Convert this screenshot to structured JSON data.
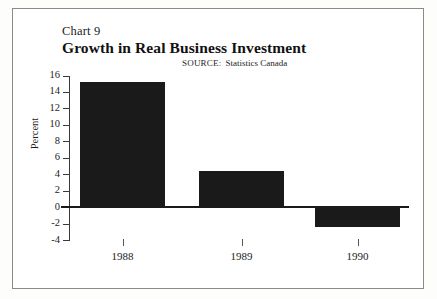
{
  "chart_data": {
    "type": "bar",
    "title": "Growth in Real Business Investment",
    "chart_number": "Chart 9",
    "source_label": "SOURCE:",
    "source_value": "Statistics Canada",
    "categories": [
      "1988",
      "1989",
      "1990"
    ],
    "values": [
      15.3,
      4.5,
      -2.3
    ],
    "xlabel": "",
    "ylabel": "Percent",
    "ylim": [
      -4,
      16
    ],
    "ytick_step": 2,
    "yticks": [
      "16",
      "14",
      "12",
      "10",
      "8",
      "6",
      "4",
      "2",
      "0",
      "-2",
      "-4"
    ],
    "grid": false,
    "legend": "none",
    "bar_color": "#1a1a1a",
    "axis_color": "#3a3a3a",
    "frame_color": "#8a8a8a",
    "background": "#ffffff"
  }
}
